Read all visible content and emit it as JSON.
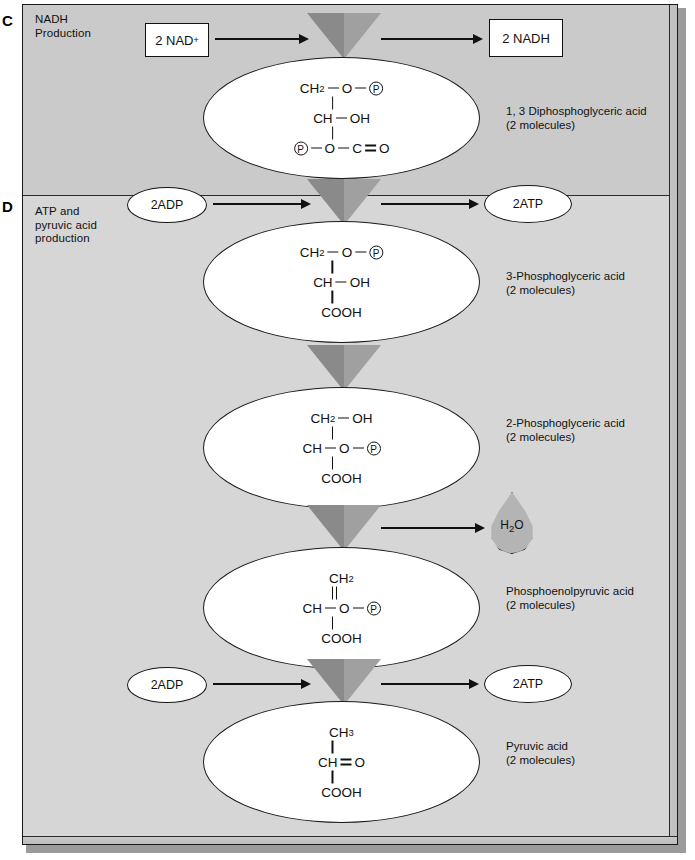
{
  "figure": {
    "colors": {
      "section_c_bg": "#cacaca",
      "section_d_bg": "#d6d6d6",
      "panel_border": "#1a1a1a",
      "enzyme_triangle_dark": "#8a8a8a",
      "enzyme_triangle_light": "#a0a0a0",
      "droplet_fill": "#b4b4b4",
      "bubble_fill": "#ffffff"
    }
  },
  "sections": [
    {
      "letter": "C",
      "caption": "NADH\nProduction"
    },
    {
      "letter": "D",
      "caption": "ATP and\npyruvic acid\nproduction"
    }
  ],
  "inputs": [
    {
      "id": "nad",
      "label": "2 NAD",
      "superscript": "+",
      "shape": "box"
    },
    {
      "id": "adp1",
      "label": "2ADP",
      "shape": "ellipse"
    },
    {
      "id": "adp2",
      "label": "2ADP",
      "shape": "ellipse"
    }
  ],
  "outputs": [
    {
      "id": "nadh",
      "label": "2 NADH",
      "shape": "box"
    },
    {
      "id": "atp1",
      "label": "2ATP",
      "shape": "ellipse"
    },
    {
      "id": "atp2",
      "label": "2ATP",
      "shape": "ellipse"
    },
    {
      "id": "water",
      "label": "H",
      "sub": "2",
      "label2": "O",
      "shape": "droplet"
    }
  ],
  "metabolites": [
    {
      "id": "dpg",
      "name": "1, 3 Diphosphoglyceric acid",
      "count": "(2 molecules)",
      "structure": [
        {
          "kind": "row",
          "parts": [
            {
              "t": "txt",
              "v": "CH"
            },
            {
              "t": "sub",
              "v": "2"
            },
            {
              "t": "dash"
            },
            {
              "t": "txt",
              "v": "O"
            },
            {
              "t": "dash"
            },
            {
              "t": "pcirc",
              "v": "P"
            }
          ]
        },
        {
          "kind": "bond",
          "order": "single"
        },
        {
          "kind": "row",
          "parts": [
            {
              "t": "txt",
              "v": "CH"
            },
            {
              "t": "dash"
            },
            {
              "t": "txt",
              "v": "OH"
            }
          ]
        },
        {
          "kind": "bond",
          "order": "single"
        },
        {
          "kind": "row",
          "parts": [
            {
              "t": "pcirc",
              "v": "P"
            },
            {
              "t": "dash"
            },
            {
              "t": "txt",
              "v": "O"
            },
            {
              "t": "dash"
            },
            {
              "t": "txt",
              "v": "C"
            },
            {
              "t": "eq"
            },
            {
              "t": "txt",
              "v": "O"
            }
          ]
        }
      ]
    },
    {
      "id": "pg3",
      "name": "3-Phosphoglyceric acid",
      "count": "(2 molecules)",
      "structure": [
        {
          "kind": "row",
          "parts": [
            {
              "t": "txt",
              "v": "CH"
            },
            {
              "t": "sub",
              "v": "2"
            },
            {
              "t": "dash"
            },
            {
              "t": "txt",
              "v": "O"
            },
            {
              "t": "dash"
            },
            {
              "t": "pcirc",
              "v": "P"
            }
          ]
        },
        {
          "kind": "bond",
          "order": "single"
        },
        {
          "kind": "row",
          "parts": [
            {
              "t": "txt",
              "v": "CH"
            },
            {
              "t": "dash"
            },
            {
              "t": "txt",
              "v": "OH"
            }
          ]
        },
        {
          "kind": "bond",
          "order": "single"
        },
        {
          "kind": "row",
          "parts": [
            {
              "t": "txt",
              "v": "COOH"
            }
          ]
        }
      ]
    },
    {
      "id": "pg2",
      "name": "2-Phosphoglyceric acid",
      "count": "(2 molecules)",
      "structure": [
        {
          "kind": "row",
          "parts": [
            {
              "t": "txt",
              "v": "CH"
            },
            {
              "t": "sub",
              "v": "2"
            },
            {
              "t": "dash"
            },
            {
              "t": "txt",
              "v": "OH"
            }
          ]
        },
        {
          "kind": "bond",
          "order": "single"
        },
        {
          "kind": "row",
          "parts": [
            {
              "t": "txt",
              "v": "CH"
            },
            {
              "t": "dash"
            },
            {
              "t": "txt",
              "v": "O"
            },
            {
              "t": "dash"
            },
            {
              "t": "pcirc",
              "v": "P"
            }
          ]
        },
        {
          "kind": "bond",
          "order": "single"
        },
        {
          "kind": "row",
          "parts": [
            {
              "t": "txt",
              "v": "COOH"
            }
          ]
        }
      ]
    },
    {
      "id": "pep",
      "name": "Phosphoenolpyruvic acid",
      "count": "(2 molecules)",
      "structure": [
        {
          "kind": "row",
          "parts": [
            {
              "t": "txt",
              "v": "CH"
            },
            {
              "t": "sub",
              "v": "2"
            }
          ]
        },
        {
          "kind": "bond",
          "order": "double"
        },
        {
          "kind": "row",
          "parts": [
            {
              "t": "txt",
              "v": "CH"
            },
            {
              "t": "dash"
            },
            {
              "t": "txt",
              "v": "O"
            },
            {
              "t": "dash"
            },
            {
              "t": "pcirc",
              "v": "P"
            }
          ]
        },
        {
          "kind": "bond",
          "order": "single"
        },
        {
          "kind": "row",
          "parts": [
            {
              "t": "txt",
              "v": "COOH"
            }
          ]
        }
      ]
    },
    {
      "id": "pyr",
      "name": "Pyruvic acid",
      "count": "(2 molecules)",
      "structure": [
        {
          "kind": "row",
          "parts": [
            {
              "t": "txt",
              "v": "CH"
            },
            {
              "t": "sub",
              "v": "3"
            }
          ]
        },
        {
          "kind": "bond",
          "order": "single"
        },
        {
          "kind": "row",
          "parts": [
            {
              "t": "txt",
              "v": "CH"
            },
            {
              "t": "eq"
            },
            {
              "t": "txt",
              "v": "O"
            }
          ]
        },
        {
          "kind": "bond",
          "order": "single"
        },
        {
          "kind": "row",
          "parts": [
            {
              "t": "txt",
              "v": "COOH"
            }
          ]
        }
      ]
    }
  ],
  "enzyme_steps": [
    {
      "id": "step-nadh",
      "icon": "enzyme-funnel-triangle"
    },
    {
      "id": "step-atp1",
      "icon": "enzyme-funnel-triangle"
    },
    {
      "id": "step-mutase",
      "icon": "enzyme-funnel-triangle"
    },
    {
      "id": "step-enolase",
      "icon": "enzyme-funnel-triangle"
    },
    {
      "id": "step-atp2",
      "icon": "enzyme-funnel-triangle"
    }
  ]
}
